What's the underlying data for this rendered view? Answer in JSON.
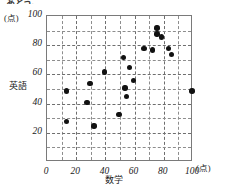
{
  "figure": {
    "top_clipped_text": "あとう。",
    "y_unit_label": "(点)",
    "x_unit_label": "(点)",
    "y_axis_title": "英語",
    "x_axis_title": "数学"
  },
  "chart_data": {
    "type": "scatter",
    "title": "",
    "xlabel": "数学",
    "ylabel": "英語",
    "x_unit": "(点)",
    "y_unit": "(点)",
    "xlim": [
      0,
      100
    ],
    "ylim": [
      0,
      100
    ],
    "xticks": [
      0,
      20,
      40,
      60,
      80,
      100
    ],
    "yticks": [
      20,
      40,
      60,
      80,
      100
    ],
    "grid": true,
    "grid_step": 10,
    "legend": "none",
    "marker": "filled-circle",
    "marker_color": "#111111",
    "n_points": 22,
    "points": [
      {
        "x": 14,
        "y": 48
      },
      {
        "x": 14,
        "y": 27
      },
      {
        "x": 28,
        "y": 40
      },
      {
        "x": 30,
        "y": 53
      },
      {
        "x": 33,
        "y": 24
      },
      {
        "x": 40,
        "y": 61
      },
      {
        "x": 50,
        "y": 32
      },
      {
        "x": 53,
        "y": 71
      },
      {
        "x": 54,
        "y": 50
      },
      {
        "x": 55,
        "y": 44
      },
      {
        "x": 57,
        "y": 64
      },
      {
        "x": 60,
        "y": 55
      },
      {
        "x": 67,
        "y": 77
      },
      {
        "x": 73,
        "y": 76
      },
      {
        "x": 76,
        "y": 91
      },
      {
        "x": 76,
        "y": 87
      },
      {
        "x": 79,
        "y": 85
      },
      {
        "x": 84,
        "y": 77
      },
      {
        "x": 86,
        "y": 73
      },
      {
        "x": 100,
        "y": 48
      }
    ]
  }
}
